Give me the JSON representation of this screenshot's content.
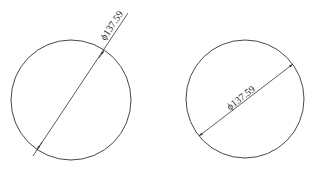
{
  "figures": [
    {
      "id": "left",
      "style": "diameter dimension with leader outside circle",
      "label": "ϕ137.59",
      "circle": {
        "cx": 71,
        "cy": 100,
        "r": 60
      },
      "line": {
        "x1": 33,
        "y1": 156,
        "x2": 128,
        "y2": 13
      }
    },
    {
      "id": "right",
      "style": "diameter dimension inside circle",
      "label": "ϕ137.59",
      "circle": {
        "cx": 245,
        "cy": 99,
        "r": 59
      },
      "line": {
        "x1": 199,
        "y1": 136,
        "x2": 293,
        "y2": 64
      }
    }
  ],
  "colors": {
    "stroke": "#333333",
    "background": "#ffffff"
  }
}
